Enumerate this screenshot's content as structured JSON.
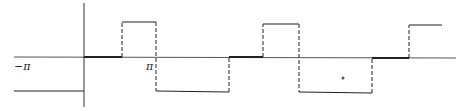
{
  "figure": {
    "type": "piecewise-periodic-function-plot",
    "labels": {
      "neg_pi": "−π",
      "pi": "π"
    },
    "colors": {
      "line": "#222222",
      "axis": "#555555",
      "background": "#ffffff"
    },
    "levels": {
      "top": 1,
      "zero": 0,
      "bottom": -1
    },
    "segments": [
      {
        "from": "-pi-ish",
        "to": "0",
        "level": -1,
        "style": "solid"
      },
      {
        "from": "0",
        "to": "a",
        "level": 0,
        "style": "solid-thick"
      },
      {
        "from": "a",
        "to": "pi",
        "level": 1,
        "style": "solid"
      },
      {
        "from": "pi",
        "to": "b",
        "level": -1,
        "style": "solid"
      },
      {
        "from": "b",
        "to": "c",
        "level": 0,
        "style": "solid-thick"
      },
      {
        "from": "c",
        "to": "d",
        "level": 1,
        "style": "solid"
      },
      {
        "from": "d",
        "to": "e",
        "level": -1,
        "style": "solid"
      },
      {
        "from": "e",
        "to": "f",
        "level": 0,
        "style": "solid-thick"
      },
      {
        "from": "f",
        "to": "g",
        "level": 1,
        "style": "solid"
      }
    ],
    "jumps_style": "dashed"
  }
}
